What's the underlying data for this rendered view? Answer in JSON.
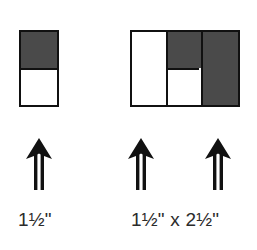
{
  "page": {
    "background_color": "#ffffff",
    "ink_color": "#111111",
    "fill_dark": "#4a4a4a",
    "fill_light": "#ffffff",
    "text_color": "#2b2b2b"
  },
  "figure": {
    "type": "block-diagram",
    "groups": [
      {
        "id": "left-block",
        "caption": "1½\"",
        "cells": [
          {
            "id": "left-top-cell",
            "fill": "dark",
            "position": "top"
          },
          {
            "id": "left-bottom-cell",
            "fill": "light",
            "position": "bottom"
          }
        ],
        "arrows": [
          {
            "id": "arrow-1",
            "direction": "up"
          }
        ]
      },
      {
        "id": "right-block",
        "caption": "1½\" x 2½\"",
        "cells": [
          {
            "id": "right-left-cell",
            "fill": "light",
            "position": "left-full-height"
          },
          {
            "id": "right-middle-top-cell",
            "fill": "dark",
            "position": "middle-top"
          },
          {
            "id": "right-middle-bot-cell",
            "fill": "light",
            "position": "middle-bottom"
          },
          {
            "id": "right-right-cell",
            "fill": "dark",
            "position": "right-full-height"
          }
        ],
        "arrows": [
          {
            "id": "arrow-2",
            "direction": "up"
          },
          {
            "id": "arrow-3",
            "direction": "up"
          }
        ]
      }
    ]
  },
  "icons": {
    "arrow_up": "arrow-up-icon"
  }
}
